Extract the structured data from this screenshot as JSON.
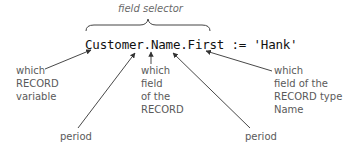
{
  "title": "field selector",
  "code": "Customer.Name.First := 'Hank'",
  "labels": {
    "record_variable": "which\nRECORD\nvariable",
    "field_of_record": "which\nfield\nof the\nRECORD",
    "field_of_type": "which\nfield of the\nRECORD type\nName",
    "period_left": "period",
    "period_right": "period"
  },
  "colors": {
    "text": "#111111",
    "annotation": "#5a5a5a",
    "arrow": "#333333"
  }
}
